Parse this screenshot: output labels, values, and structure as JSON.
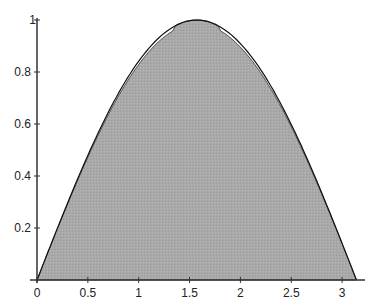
{
  "chart_data": {
    "type": "area",
    "title": "",
    "xlabel": "",
    "ylabel": "",
    "xlim": [
      0,
      3.14159
    ],
    "ylim": [
      0,
      1
    ],
    "grid": false,
    "legend": null,
    "x_ticks": [
      "0",
      "0.5",
      "1",
      "1.5",
      "2",
      "2.5",
      "3"
    ],
    "y_ticks": [
      "0.2",
      "0.4",
      "0.6",
      "0.8",
      "1"
    ],
    "series": [
      {
        "name": "sin(x)",
        "style": "line",
        "color": "#111111",
        "x": [
          0,
          0.5,
          1,
          1.5708,
          2,
          2.5,
          3.14159
        ],
        "y": [
          0,
          0.479,
          0.841,
          1,
          0.909,
          0.598,
          0
        ]
      },
      {
        "name": "parabola approximation",
        "style": "filled-area",
        "color": "#a8a8a8",
        "x": [
          0,
          0.5,
          1,
          1.5708,
          2,
          2.5,
          3.14159
        ],
        "y": [
          0,
          0.535,
          0.869,
          1,
          0.924,
          0.608,
          0
        ]
      }
    ]
  }
}
